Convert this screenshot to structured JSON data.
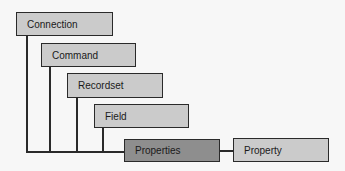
{
  "diagram": {
    "colors": {
      "box_fill": "#cbcbcb",
      "highlight_fill": "#8e8e8e",
      "line": "#2a2a2a"
    },
    "nodes": [
      {
        "id": "connection",
        "label": "Connection"
      },
      {
        "id": "command",
        "label": "Command"
      },
      {
        "id": "recordset",
        "label": "Recordset"
      },
      {
        "id": "field",
        "label": "Field"
      },
      {
        "id": "properties",
        "label": "Properties",
        "highlighted": true
      },
      {
        "id": "property",
        "label": "Property"
      }
    ],
    "edges": [
      {
        "from": "connection",
        "to": "properties"
      },
      {
        "from": "command",
        "to": "properties"
      },
      {
        "from": "recordset",
        "to": "properties"
      },
      {
        "from": "field",
        "to": "properties"
      },
      {
        "from": "properties",
        "to": "property"
      }
    ]
  }
}
